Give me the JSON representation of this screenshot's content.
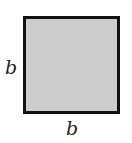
{
  "figure": {
    "shape": "square",
    "fill_color": "#cdcdcd",
    "border_color": "#111111",
    "labels": {
      "left_side": "b",
      "bottom_side": "b"
    }
  }
}
